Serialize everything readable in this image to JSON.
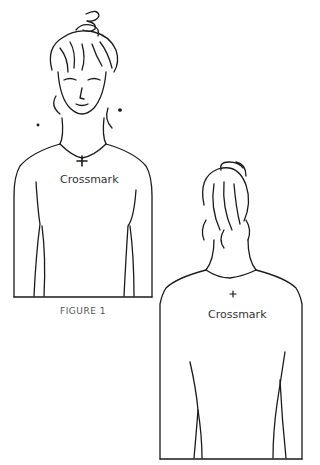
{
  "figure": {
    "caption": "FIGURE 1",
    "front_view": {
      "label": "Crossmark",
      "mark_symbol": "+"
    },
    "back_view": {
      "label": "Crossmark",
      "mark_symbol": "+"
    }
  },
  "colors": {
    "line": "#1a1a1a",
    "background": "#ffffff",
    "text": "#333333"
  }
}
